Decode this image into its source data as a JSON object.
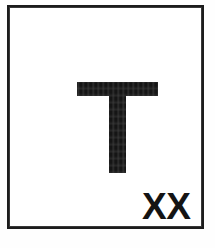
{
  "image": {
    "kind": "scanned-label-card",
    "background_color": "#ffffff",
    "ink_color": "#151515",
    "width": 215,
    "height": 248
  },
  "frame": {
    "name": "border-rectangle",
    "stroke_color": "#1c1c1c",
    "stroke_width": 3
  },
  "main": {
    "big_letter": "T",
    "corner_mark": "XX"
  }
}
